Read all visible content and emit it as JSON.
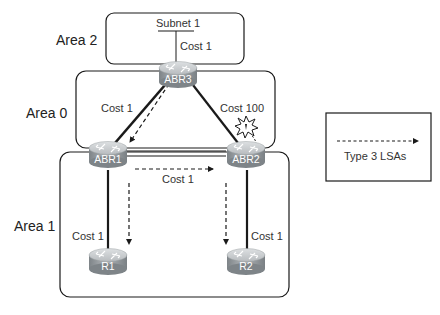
{
  "diagram": {
    "areas": [
      {
        "id": "area2",
        "label": "Area 2"
      },
      {
        "id": "area0",
        "label": "Area 0"
      },
      {
        "id": "area1",
        "label": "Area 1"
      }
    ],
    "subnet": {
      "label": "Subnet 1"
    },
    "routers": [
      {
        "id": "abr3",
        "label": "ABR3"
      },
      {
        "id": "abr1",
        "label": "ABR1"
      },
      {
        "id": "abr2",
        "label": "ABR2"
      },
      {
        "id": "r1",
        "label": "R1"
      },
      {
        "id": "r2",
        "label": "R2"
      }
    ],
    "links": [
      {
        "from": "subnet1",
        "to": "abr3",
        "cost_label": "Cost 1"
      },
      {
        "from": "abr3",
        "to": "abr1",
        "cost_label": "Cost 1"
      },
      {
        "from": "abr3",
        "to": "abr2",
        "cost_label": "Cost 100",
        "failure_marker": true
      },
      {
        "from": "abr1",
        "to": "abr2",
        "cost_label": "Cost 1"
      },
      {
        "from": "abr1",
        "to": "r1",
        "cost_label": "Cost 1"
      },
      {
        "from": "abr2",
        "to": "r2",
        "cost_label": "Cost 1"
      }
    ],
    "lsa_flows": [
      {
        "from": "abr3",
        "to": "abr1"
      },
      {
        "from": "abr1",
        "to": "abr2"
      },
      {
        "from": "abr1",
        "to": "r1"
      },
      {
        "from": "abr2",
        "to": "r2"
      }
    ],
    "legend": {
      "label": "Type 3 LSAs"
    },
    "colors": {
      "line": "#1a1a1a",
      "router_top": "#c9cccf",
      "router_side": "#8d9296",
      "router_text": "#ffffff"
    }
  }
}
